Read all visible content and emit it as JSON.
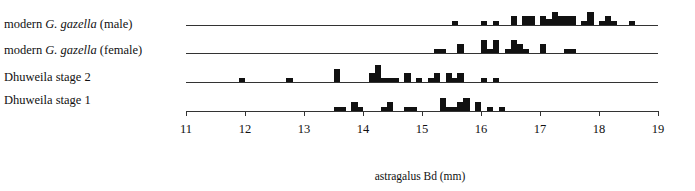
{
  "chart_data": {
    "type": "bar",
    "subtype": "stacked-row-histogram",
    "title": "",
    "xlabel": "astragalus Bd (mm)",
    "ylabel": "",
    "xlim": [
      11,
      19
    ],
    "x_ticks": [
      11,
      12,
      13,
      14,
      15,
      16,
      17,
      18,
      19
    ],
    "bin_width_mm": 0.1,
    "grid": false,
    "legend": null,
    "series": [
      {
        "name": "modern G. gazella (male)",
        "label_prefix": "modern ",
        "label_italic": "G. gazella",
        "label_suffix": " (male)",
        "bins": [
          {
            "x": 15.5,
            "count": 1
          },
          {
            "x": 16.0,
            "count": 1
          },
          {
            "x": 16.2,
            "count": 1
          },
          {
            "x": 16.5,
            "count": 2
          },
          {
            "x": 16.7,
            "count": 2
          },
          {
            "x": 16.8,
            "count": 2
          },
          {
            "x": 17.0,
            "count": 2
          },
          {
            "x": 17.1,
            "count": 1.5
          },
          {
            "x": 17.2,
            "count": 3
          },
          {
            "x": 17.3,
            "count": 2
          },
          {
            "x": 17.4,
            "count": 2
          },
          {
            "x": 17.5,
            "count": 2
          },
          {
            "x": 17.7,
            "count": 1
          },
          {
            "x": 17.8,
            "count": 3
          },
          {
            "x": 18.0,
            "count": 1
          },
          {
            "x": 18.1,
            "count": 2
          },
          {
            "x": 18.2,
            "count": 1
          },
          {
            "x": 18.5,
            "count": 1
          }
        ]
      },
      {
        "name": "modern G. gazella (female)",
        "label_prefix": "modern ",
        "label_italic": "G. gazella",
        "label_suffix": " (female)",
        "bins": [
          {
            "x": 15.2,
            "count": 1
          },
          {
            "x": 15.3,
            "count": 1
          },
          {
            "x": 15.6,
            "count": 2
          },
          {
            "x": 16.0,
            "count": 3
          },
          {
            "x": 16.1,
            "count": 1
          },
          {
            "x": 16.2,
            "count": 3
          },
          {
            "x": 16.4,
            "count": 1
          },
          {
            "x": 16.5,
            "count": 3
          },
          {
            "x": 16.6,
            "count": 2
          },
          {
            "x": 16.7,
            "count": 1
          },
          {
            "x": 17.0,
            "count": 2
          },
          {
            "x": 17.4,
            "count": 1
          },
          {
            "x": 17.5,
            "count": 1
          }
        ]
      },
      {
        "name": "Dhuweila stage 2",
        "label_prefix": "Dhuweila stage 2",
        "label_italic": "",
        "label_suffix": "",
        "bins": [
          {
            "x": 11.9,
            "count": 1
          },
          {
            "x": 12.7,
            "count": 1
          },
          {
            "x": 13.5,
            "count": 3
          },
          {
            "x": 14.1,
            "count": 2
          },
          {
            "x": 14.2,
            "count": 4
          },
          {
            "x": 14.3,
            "count": 1
          },
          {
            "x": 14.4,
            "count": 1
          },
          {
            "x": 14.5,
            "count": 1
          },
          {
            "x": 14.7,
            "count": 2
          },
          {
            "x": 14.9,
            "count": 1
          },
          {
            "x": 15.1,
            "count": 1
          },
          {
            "x": 15.2,
            "count": 2
          },
          {
            "x": 15.4,
            "count": 2
          },
          {
            "x": 15.5,
            "count": 1
          },
          {
            "x": 15.6,
            "count": 2
          },
          {
            "x": 16.0,
            "count": 1
          },
          {
            "x": 16.2,
            "count": 1
          }
        ]
      },
      {
        "name": "Dhuweila stage 1",
        "label_prefix": "Dhuweila stage 1",
        "label_italic": "",
        "label_suffix": "",
        "bins": [
          {
            "x": 13.5,
            "count": 1
          },
          {
            "x": 13.6,
            "count": 1
          },
          {
            "x": 13.8,
            "count": 2
          },
          {
            "x": 13.9,
            "count": 1
          },
          {
            "x": 14.3,
            "count": 1
          },
          {
            "x": 14.4,
            "count": 2
          },
          {
            "x": 14.7,
            "count": 1
          },
          {
            "x": 14.8,
            "count": 1
          },
          {
            "x": 15.3,
            "count": 3
          },
          {
            "x": 15.4,
            "count": 1
          },
          {
            "x": 15.5,
            "count": 1
          },
          {
            "x": 15.6,
            "count": 2
          },
          {
            "x": 15.7,
            "count": 3
          },
          {
            "x": 15.9,
            "count": 2
          },
          {
            "x": 16.1,
            "count": 1
          },
          {
            "x": 16.3,
            "count": 1
          }
        ]
      }
    ]
  }
}
